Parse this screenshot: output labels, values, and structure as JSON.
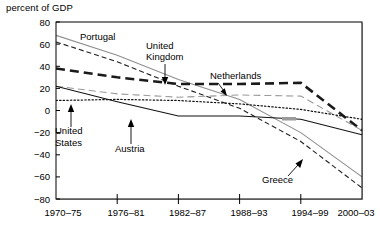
{
  "chart_data": {
    "type": "line",
    "title": "percent of GDP",
    "xlabel": "",
    "ylabel": "percent of GDP",
    "categories": [
      "1970–75",
      "1976–81",
      "1982–87",
      "1988–93",
      "1994–99",
      "2000–03"
    ],
    "x_tick_labels": [
      "1970–75",
      "1976–81",
      "1982–87",
      "1988–93",
      "1994–99",
      "2000–03"
    ],
    "y_tick_labels": [
      "80",
      "60",
      "40",
      "20",
      "0",
      "−20",
      "−40",
      "−60",
      "−80"
    ],
    "y_ticks": [
      80,
      60,
      40,
      20,
      0,
      -20,
      -40,
      -60,
      -80
    ],
    "ylim": [
      -80,
      80
    ],
    "grid": false,
    "legend": "none",
    "legend_position": "inline-annotations",
    "series": [
      {
        "name": "Portugal",
        "style": "solid-light",
        "color": "#8c8c8c",
        "values": [
          68,
          50,
          28,
          10,
          -20,
          -60
        ]
      },
      {
        "name": "Greece",
        "style": "dashed",
        "color": "#1a1a1a",
        "values": [
          62,
          44,
          22,
          2,
          -28,
          -70
        ]
      },
      {
        "name": "United Kingdom",
        "style": "thick-dashed",
        "color": "#1a1a1a",
        "values": [
          38,
          30,
          24,
          24,
          25,
          -18
        ]
      },
      {
        "name": "Netherlands",
        "style": "dashed-light",
        "color": "#8c8c8c",
        "values": [
          22,
          15,
          12,
          14,
          13,
          -18
        ]
      },
      {
        "name": "United States",
        "style": "dotted",
        "color": "#1a1a1a",
        "values": [
          9,
          10,
          9,
          6,
          1,
          -8
        ]
      },
      {
        "name": "Austria",
        "style": "solid-thin",
        "color": "#1a1a1a",
        "values": [
          22,
          8,
          -5,
          -5,
          -8,
          -22
        ]
      }
    ],
    "annotations": [
      {
        "label": "Portugal",
        "target_series": "Portugal"
      },
      {
        "label": "United\nKingdom",
        "target_series": "United Kingdom"
      },
      {
        "label": "Netherlands",
        "target_series": "Netherlands"
      },
      {
        "label": "United\nStates",
        "target_series": "United States"
      },
      {
        "label": "Austria",
        "target_series": "Austria"
      },
      {
        "label": "Greece",
        "target_series": "Greece"
      }
    ]
  },
  "labels": {
    "axis_title": "percent of GDP",
    "portugal": "Portugal",
    "uk_line1": "United",
    "uk_line2": "Kingdom",
    "netherlands": "Netherlands",
    "us_line1": "United",
    "us_line2": "States",
    "austria": "Austria",
    "greece": "Greece",
    "y_80": "80",
    "y_60": "60",
    "y_40": "40",
    "y_20": "20",
    "y_0": "0",
    "y_m20": "−20",
    "y_m40": "−40",
    "y_m60": "−60",
    "y_m80": "−80",
    "x_1": "1970–75",
    "x_2": "1976–81",
    "x_3": "1982–87",
    "x_4": "1988–93",
    "x_5": "1994–99",
    "x_6": "2000–03"
  }
}
